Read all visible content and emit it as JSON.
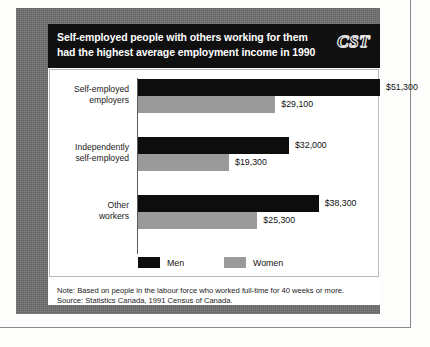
{
  "figure": {
    "title_lines": [
      "Self-employed people with others working for them",
      "had the highest average employment income in 1990"
    ],
    "logo_text": "CST",
    "notes": [
      "Note: Based on people in the labour force who worked full-time for 40 weeks or more.",
      "Source: Statistics Canada, 1991 Census of Canada."
    ]
  },
  "chart_data": {
    "type": "bar",
    "orientation": "horizontal",
    "title": "Self-employed people with others working for them had the highest average employment income in 1990",
    "xlabel": "",
    "ylabel": "",
    "xlim": [
      0,
      51300
    ],
    "grid": false,
    "legend_position": "bottom-left",
    "value_prefix": "$",
    "categories": [
      "Self-employed employers",
      "Independently self-employed",
      "Other workers"
    ],
    "category_lines": [
      [
        "Self-employed",
        "employers"
      ],
      [
        "Independently",
        "self-employed"
      ],
      [
        "Other",
        "workers"
      ]
    ],
    "series": [
      {
        "name": "Men",
        "color": "#0d0d0d",
        "values": [
          51300,
          32000,
          38300
        ],
        "labels": [
          "$51,300",
          "$32,000",
          "$38,300"
        ]
      },
      {
        "name": "Women",
        "color": "#9a9a9a",
        "values": [
          29100,
          19300,
          25300
        ],
        "labels": [
          "$29,100",
          "$19,300",
          "$25,300"
        ]
      }
    ]
  }
}
